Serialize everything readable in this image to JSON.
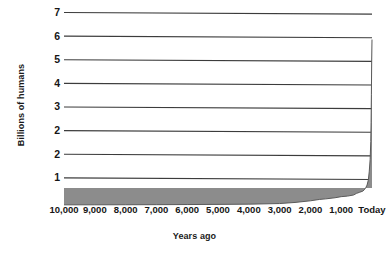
{
  "chart_data": {
    "type": "area",
    "title": "",
    "xlabel": "Years ago",
    "ylabel": "Billions of humans",
    "grid": true,
    "legend": "none",
    "x_tick_labels": [
      "10,000",
      "9,000",
      "8,000",
      "7,000",
      "6,000",
      "5,000",
      "4,000",
      "3,000",
      "2,000",
      "1,000",
      "Today"
    ],
    "x_tick_values": [
      10000,
      9000,
      8000,
      7000,
      6000,
      5000,
      4000,
      3000,
      2000,
      1000,
      0
    ],
    "y_tick_labels": [
      "7",
      "6",
      "5",
      "4",
      "3",
      "2",
      "2",
      "1"
    ],
    "y_tick_values": [
      7,
      6,
      5,
      4,
      3,
      2,
      2,
      1
    ],
    "xlim": [
      10000,
      0
    ],
    "ylim": [
      0,
      7
    ],
    "x_axis_direction": "reversed",
    "series": [
      {
        "name": "World population",
        "fill_color": "#8c8c8c",
        "line_color": "#5a5a5a",
        "x": [
          10000,
          9000,
          8000,
          7000,
          6000,
          5000,
          4000,
          3000,
          2500,
          2000,
          1700,
          1500,
          1200,
          1000,
          800,
          600,
          500,
          400,
          300,
          250,
          200,
          160,
          120,
          90,
          60,
          40,
          30,
          20,
          10,
          0
        ],
        "values": [
          0.004,
          0.005,
          0.007,
          0.01,
          0.014,
          0.02,
          0.028,
          0.05,
          0.09,
          0.15,
          0.2,
          0.22,
          0.26,
          0.3,
          0.32,
          0.36,
          0.42,
          0.46,
          0.5,
          0.55,
          0.63,
          0.72,
          0.9,
          1.2,
          1.65,
          2.3,
          3.0,
          4.0,
          5.2,
          6.0
        ]
      }
    ],
    "annotations": []
  },
  "figure": {
    "background_color": "#ffffff",
    "grid_color": "#3c3c3c",
    "text_color": "#161616"
  }
}
